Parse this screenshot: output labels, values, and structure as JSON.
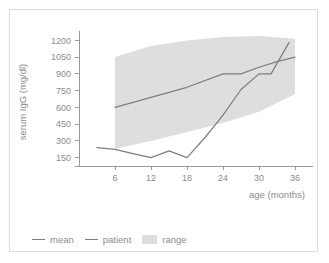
{
  "chart_data": {
    "type": "line",
    "title": "",
    "xlabel": "age (months)",
    "ylabel": "serum IgG (mg/dl)",
    "xlim": [
      0,
      38
    ],
    "ylim": [
      75,
      1275
    ],
    "xticks": [
      6,
      12,
      18,
      24,
      30,
      36
    ],
    "yticks": [
      150,
      300,
      450,
      600,
      750,
      900,
      1050,
      1200
    ],
    "grid": false,
    "legend_position": "bottom-left",
    "colors": {
      "mean_line": "#7d7d85",
      "patient_line": "#7d7d85",
      "range_band": "#dedede",
      "axis": "#9a9a9a",
      "text": "#8c8c8c",
      "frame": "#dcdcdc",
      "background": "#ffffff"
    },
    "series": [
      {
        "name": "mean",
        "x": [
          6,
          12,
          18,
          24,
          27,
          30,
          33,
          36
        ],
        "values": [
          600,
          690,
          780,
          900,
          900,
          960,
          1010,
          1050
        ]
      },
      {
        "name": "patient",
        "x": [
          3,
          6,
          9,
          12,
          15,
          18,
          21,
          24,
          27,
          30,
          32,
          35
        ],
        "values": [
          240,
          225,
          185,
          150,
          210,
          150,
          330,
          530,
          760,
          900,
          900,
          1180
        ]
      }
    ],
    "band": {
      "name": "range",
      "x": [
        6,
        12,
        18,
        24,
        30,
        36
      ],
      "upper": [
        1050,
        1150,
        1200,
        1230,
        1240,
        1215
      ],
      "lower": [
        230,
        300,
        380,
        460,
        560,
        720
      ]
    }
  },
  "legend": {
    "items": [
      {
        "label": "mean",
        "marker": "line"
      },
      {
        "label": "patient",
        "marker": "line"
      },
      {
        "label": "range",
        "marker": "box"
      }
    ]
  },
  "axes": {
    "y_tick_labels": [
      "1200",
      "1050",
      "900",
      "750",
      "600",
      "450",
      "300",
      "150"
    ],
    "x_tick_labels": [
      "6",
      "12",
      "18",
      "24",
      "30",
      "36"
    ],
    "y_title": "serum IgG (mg/dl)",
    "x_title": "age (months)"
  }
}
